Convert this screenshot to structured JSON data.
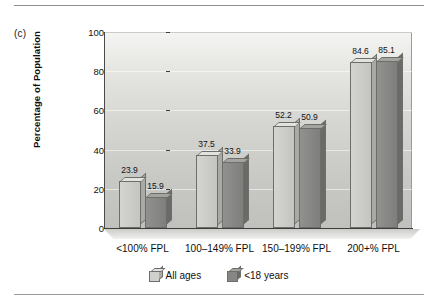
{
  "panel": {
    "label": "(c)"
  },
  "rules": {
    "top_visible": true,
    "bottom_visible": true
  },
  "chart_data": {
    "type": "bar",
    "title": "",
    "subtitle": "",
    "xlabel": "",
    "ylabel": "Percentage of Population",
    "ylim": [
      0,
      100
    ],
    "yticks": [
      0,
      20,
      40,
      60,
      80,
      100
    ],
    "ytick_labels": [
      "0",
      "20",
      "40",
      "60",
      "80",
      "100"
    ],
    "grid": true,
    "grid_axis": "y",
    "legend_position": "bottom-center",
    "categories": [
      "<100% FPL",
      "100–149% FPL",
      "150–199% FPL",
      "200+% FPL"
    ],
    "series": [
      {
        "name": "All ages",
        "color": "#c8c8c4",
        "values": [
          23.9,
          37.5,
          52.2,
          84.6
        ],
        "labels": [
          "23.9",
          "37.5",
          "52.2",
          "84.6"
        ]
      },
      {
        "name": "<18 years",
        "color": "#8a8a86",
        "values": [
          15.9,
          33.9,
          50.9,
          85.1
        ],
        "labels": [
          "15.9",
          "33.9",
          "50.9",
          "85.1"
        ]
      }
    ],
    "legend": [
      {
        "label": "All ages",
        "swatch": "light"
      },
      {
        "label": "<18 years",
        "swatch": "dark"
      }
    ]
  },
  "colors": {
    "light_bar": "#c8c8c4",
    "dark_bar": "#8a8a86",
    "axis": "#3d3d3d",
    "text": "#111111",
    "plot_bg_top": "#f4f4f2",
    "plot_bg_bottom": "#c0c0bd"
  }
}
